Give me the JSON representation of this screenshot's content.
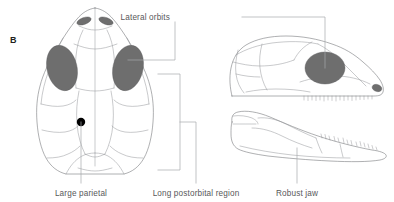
{
  "figure": {
    "panel_letter": "B",
    "background_color": "#ffffff",
    "outline_color": "#6d6e71",
    "suture_color": "#939598",
    "shade_color": "#6e6e6e",
    "leader_color": "#a7a9ac",
    "text_color": "#58585a"
  },
  "annotations": [
    {
      "id": "lateral-orbits",
      "label": "Lateral orbits",
      "position": "top-center-right",
      "points_to": [
        "dorsal-skull-orbit",
        "lateral-skull-orbit"
      ]
    },
    {
      "id": "large-parietal",
      "label": "Large parietal",
      "position": "bottom-left",
      "points_to": [
        "parietal-foramen"
      ]
    },
    {
      "id": "long-postorbital-region",
      "label": "Long postorbital region",
      "position": "bottom-center",
      "points_to": [
        "dorsal-skull-postorbital-bracket"
      ]
    },
    {
      "id": "robust-jaw",
      "label": "Robust jaw",
      "position": "bottom-right",
      "points_to": [
        "mandible-lateral-view"
      ]
    }
  ],
  "specimens": [
    {
      "id": "dorsal-skull",
      "view": "dorsal",
      "features": [
        "paired external nares",
        "paired lateral orbits",
        "parietal foramen",
        "long postorbital region"
      ]
    },
    {
      "id": "lateral-skull",
      "view": "lateral",
      "features": [
        "large orbit",
        "maxillary tooth row",
        "external naris"
      ]
    },
    {
      "id": "mandible",
      "view": "lateral",
      "features": [
        "robust dentary",
        "dentary tooth row"
      ]
    }
  ]
}
